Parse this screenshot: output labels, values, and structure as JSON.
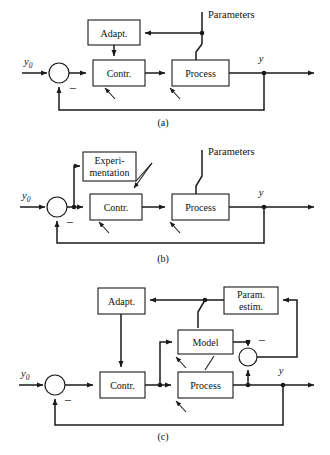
{
  "figure": {
    "background": "#ffffff",
    "line_color": "#1a1a1a"
  },
  "captions": {
    "a": "(a)",
    "b": "(b)",
    "c": "(c)"
  },
  "signals": {
    "reference": "y",
    "reference_sub": "0",
    "output": "y",
    "minus": "−"
  },
  "panel_a": {
    "caption": "(a)",
    "blocks": [
      {
        "id": "adapt",
        "label": "Adapt."
      },
      {
        "id": "contr",
        "label": "Contr."
      },
      {
        "id": "process",
        "label": "Process"
      }
    ],
    "annotations": [
      {
        "id": "parameters",
        "label": "Parameters"
      }
    ],
    "input_label": "y",
    "input_sub": "0",
    "output_label": "y",
    "summing_sign": "−"
  },
  "panel_b": {
    "caption": "(b)",
    "blocks": [
      {
        "id": "experimentation",
        "label_line1": "Experi-",
        "label_line2": "mentation"
      },
      {
        "id": "contr",
        "label": "Contr."
      },
      {
        "id": "process",
        "label": "Process"
      }
    ],
    "annotations": [
      {
        "id": "parameters",
        "label": "Parameters"
      }
    ],
    "input_label": "y",
    "input_sub": "0",
    "output_label": "y",
    "summing_sign": "−"
  },
  "panel_c": {
    "caption": "(c)",
    "blocks": [
      {
        "id": "adapt",
        "label": "Adapt."
      },
      {
        "id": "param-estim",
        "label_line1": "Param.",
        "label_line2": "estim."
      },
      {
        "id": "model",
        "label": "Model"
      },
      {
        "id": "contr",
        "label": "Contr."
      },
      {
        "id": "process",
        "label": "Process"
      }
    ],
    "input_label": "y",
    "input_sub": "0",
    "output_label": "y",
    "summing_sign": "−",
    "error_sign": "−"
  }
}
